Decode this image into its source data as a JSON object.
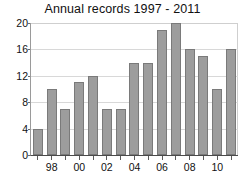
{
  "chart_data": {
    "type": "bar",
    "title": "Annual records 1997 - 2011",
    "xlabel": "",
    "ylabel": "",
    "categories": [
      "1997",
      "1998",
      "1999",
      "2000",
      "2001",
      "2002",
      "2003",
      "2004",
      "2005",
      "2006",
      "2007",
      "2008",
      "2009",
      "2010",
      "2011"
    ],
    "tick_labels": [
      "",
      "98",
      "",
      "00",
      "",
      "02",
      "",
      "04",
      "",
      "06",
      "",
      "08",
      "",
      "10",
      ""
    ],
    "values": [
      4,
      10,
      7,
      11,
      12,
      7,
      7,
      14,
      14,
      19,
      20,
      16,
      15,
      10,
      16
    ],
    "ylim": [
      0,
      20
    ],
    "yticks": [
      0,
      4,
      8,
      12,
      16,
      20
    ],
    "ytick_labels": [
      "0",
      "4",
      "8",
      "12",
      "16",
      "20"
    ],
    "grid": true,
    "grid_axis": "y",
    "legend": "none",
    "bar_color": "#9d9d9d",
    "bar_edge_color": "#7a7a7a",
    "grid_color": "#d8d8d8",
    "axis_color": "#4a4a4a",
    "background_color": "#ffffff"
  }
}
